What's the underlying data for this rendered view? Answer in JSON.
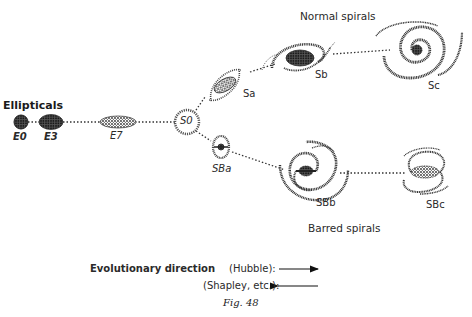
{
  "diagram": {
    "groups": {
      "ellipticals": "Ellipticals",
      "normal_spirals": "Normal spirals",
      "barred_spirals": "Barred spirals"
    },
    "nodes": {
      "e0": "E0",
      "e3": "E3",
      "e7": "E7",
      "s0": "S0",
      "sa": "Sa",
      "sb": "Sb",
      "sc": "Sc",
      "sba": "SBa",
      "sbb": "SBb",
      "sbc": "SBc"
    },
    "legend": {
      "title": "Evolutionary direction",
      "hubble": "(Hubble):",
      "shapley": "(Shapley, etc.):"
    },
    "caption": "Fig. 48",
    "colors": {
      "ink": "#2a2a2a",
      "background": "#ffffff"
    }
  }
}
